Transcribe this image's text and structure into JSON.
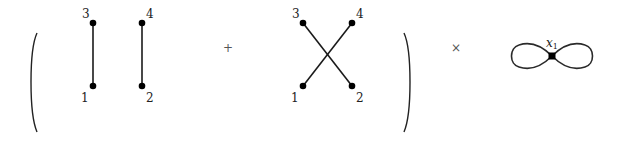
{
  "diagram": {
    "operators": {
      "plus": "+",
      "times": "×"
    },
    "term_1": {
      "labels": {
        "top_left": "3",
        "top_right": "4",
        "bottom_left": "1",
        "bottom_right": "2"
      },
      "edges": [
        [
          "1",
          "3"
        ],
        [
          "2",
          "4"
        ]
      ]
    },
    "term_2": {
      "labels": {
        "top_left": "3",
        "top_right": "4",
        "bottom_left": "1",
        "bottom_right": "2"
      },
      "edges": [
        [
          "1",
          "4"
        ],
        [
          "3",
          "2"
        ]
      ]
    },
    "factor": {
      "type": "figure-eight",
      "vertex_label": "x",
      "vertex_subscript": "1"
    }
  }
}
